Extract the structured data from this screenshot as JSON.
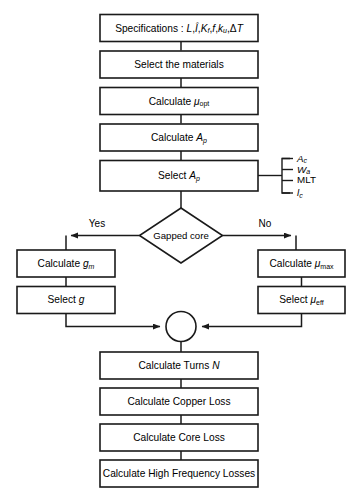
{
  "diagram": {
    "colors": {
      "stroke": "#1a1a1a",
      "fill": "#ffffff",
      "background": "#ffffff"
    },
    "nodes": {
      "specifications": {
        "label": "Specifications : L,Î,K_f,f,k_u,ΔT",
        "type": "process"
      },
      "select_materials": {
        "label": "Select the materials",
        "type": "process"
      },
      "calculate_mu_opt": {
        "label": "Calculate μ_opt",
        "type": "process"
      },
      "calculate_ap": {
        "label": "Calculate A_p",
        "type": "process"
      },
      "select_ap": {
        "label": "Select A_p",
        "type": "process"
      },
      "gapped_core": {
        "label": "Gapped core",
        "type": "decision"
      },
      "calculate_gm": {
        "label": "Calculate g_m",
        "type": "process"
      },
      "select_g": {
        "label": "Select g",
        "type": "process"
      },
      "calculate_mu_max": {
        "label": "Calculate μ_max",
        "type": "process"
      },
      "select_mu_eff": {
        "label": "Select μ_eff",
        "type": "process"
      },
      "merge": {
        "label": "",
        "type": "connector"
      },
      "calculate_turns": {
        "label": "Calculate Turns N",
        "type": "process"
      },
      "calculate_copper_loss": {
        "label": "Calculate Copper Loss",
        "type": "process"
      },
      "calculate_core_loss": {
        "label": "Calculate Core Loss",
        "type": "process"
      },
      "calculate_hf_losses": {
        "label": "Calculate High Frequency Losses",
        "type": "process"
      }
    },
    "branch_labels": {
      "yes": "Yes",
      "no": "No"
    },
    "side_outputs": [
      {
        "label": "A_c"
      },
      {
        "label": "W_a"
      },
      {
        "label": "MLT"
      },
      {
        "label": "l_c"
      }
    ],
    "text": {
      "specifications_prefix": "Specifications : ",
      "spec_L": "L",
      "spec_Ihat": "Î",
      "spec_Kf": "K",
      "spec_Kf_sub": "f",
      "spec_f": "f",
      "spec_ku": "k",
      "spec_ku_sub": "u",
      "spec_dT": "ΔT",
      "comma": ",",
      "select_materials": "Select the materials",
      "calculate": "Calculate ",
      "select": "Select ",
      "mu": "μ",
      "sub_opt": "opt",
      "sub_max": "max",
      "sub_eff": "eff",
      "sub_m": "m",
      "sub_p": "p",
      "sub_c": "c",
      "sub_a": "a",
      "A": "A",
      "W": "W",
      "l": "l",
      "g": "g",
      "N": "N",
      "MLT": "MLT",
      "turns_prefix": "Calculate Turns ",
      "copper_loss": "Calculate Copper Loss",
      "core_loss": "Calculate Core Loss",
      "hf_losses": "Calculate High Frequency Losses",
      "gapped_core": "Gapped core",
      "yes": "Yes",
      "no": "No"
    }
  }
}
